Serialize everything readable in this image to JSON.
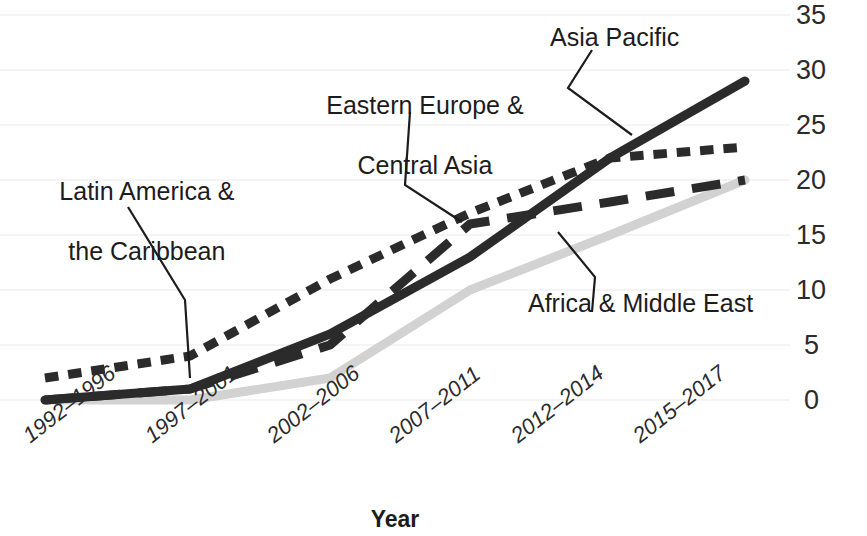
{
  "chart_data": {
    "type": "line",
    "title": "",
    "xlabel": "Year",
    "ylabel": "# of institutions offering HMF",
    "categories": [
      "1992–1996",
      "1997–2001",
      "2002–2006",
      "2007–2011",
      "2012–2014",
      "2015–2017"
    ],
    "ylim": [
      0,
      35
    ],
    "yticks": [
      0,
      5,
      10,
      15,
      20,
      25,
      30,
      35
    ],
    "ytick_labels": [
      "0",
      "5",
      "10",
      "15",
      "20",
      "25",
      "30",
      "35"
    ],
    "grid": true,
    "y_axis_position": "right",
    "legend": "annotations",
    "series": [
      {
        "name": "Latin America & the Caribbean",
        "values": [
          2,
          4,
          11,
          17,
          22,
          23
        ],
        "style": "dotted",
        "color": "#2b2b2b",
        "width": 9
      },
      {
        "name": "Eastern Europe & Central Asia",
        "values": [
          0,
          1,
          5,
          16,
          18,
          20
        ],
        "style": "dashed",
        "color": "#2b2b2b",
        "width": 9
      },
      {
        "name": "Asia Pacific",
        "values": [
          0,
          1,
          6,
          13,
          22,
          29
        ],
        "style": "solid",
        "color": "#2b2b2b",
        "width": 9
      },
      {
        "name": "Africa & Middle East",
        "values": [
          0,
          0,
          2,
          10,
          15,
          20
        ],
        "style": "solid",
        "color": "#d2d2d2",
        "width": 9
      }
    ],
    "annotations": [
      {
        "label": "Latin America &\nthe Caribbean",
        "target_series": "Latin America & the Caribbean"
      },
      {
        "label": "Eastern Europe &\nCentral Asia",
        "target_series": "Eastern Europe & Central Asia"
      },
      {
        "label": "Asia Pacific",
        "target_series": "Asia Pacific"
      },
      {
        "label": "Africa & Middle East",
        "target_series": "Africa & Middle East"
      }
    ]
  },
  "axes": {
    "x_title": "Year",
    "y_title": "# of institutions offering HMF",
    "y_labels": [
      "35",
      "30",
      "25",
      "20",
      "15",
      "10",
      "5",
      "0"
    ],
    "x_labels": [
      "1992–1996",
      "1997–2001",
      "2002–2006",
      "2007–2011",
      "2012–2014",
      "2015–2017"
    ]
  },
  "annotations": {
    "latin_line1": "Latin America &",
    "latin_line2": "the Caribbean",
    "eastern_line1": "Eastern Europe &",
    "eastern_line2": "Central Asia",
    "asia": "Asia Pacific",
    "africa": "Africa & Middle East"
  },
  "colors": {
    "ink": "#2b2b2b",
    "light_series": "#d2d2d2",
    "grid": "#f0f0f0"
  }
}
